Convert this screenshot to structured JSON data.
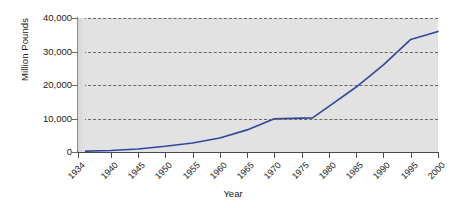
{
  "chart_data": {
    "type": "line",
    "title": "",
    "xlabel": "Year",
    "ylabel": "Million Pounds",
    "xlim": [
      1934,
      2000
    ],
    "ylim": [
      0,
      40000
    ],
    "grid": true,
    "legend": false,
    "legend_position": "none",
    "line_color": "#33469b",
    "plot_background": "#e2e2e2",
    "gridline_color": "#666666",
    "y_ticks": [
      0,
      10000,
      20000,
      30000,
      40000
    ],
    "y_tick_labels": [
      "0",
      "10,000",
      "20,000",
      "30,000",
      "40,000"
    ],
    "x_ticks": [
      1934,
      1940,
      1945,
      1950,
      1955,
      1960,
      1965,
      1970,
      1975,
      1980,
      1985,
      1990,
      1995,
      2000
    ],
    "x_tick_labels": [
      "1934",
      "1940",
      "1945",
      "1950",
      "1955",
      "1960",
      "1965",
      "1970",
      "1975",
      "1980",
      "1985",
      "1990",
      "1995",
      "2000"
    ],
    "series": [
      {
        "name": "Million Pounds",
        "color": "#33469b",
        "x": [
          1934,
          1940,
          1945,
          1950,
          1955,
          1960,
          1965,
          1970,
          1975,
          1977,
          1980,
          1985,
          1990,
          1995,
          2000
        ],
        "values": [
          200,
          450,
          900,
          1700,
          2700,
          4200,
          6600,
          9900,
          10100,
          10200,
          13600,
          19400,
          26000,
          33600,
          36000
        ]
      }
    ]
  }
}
